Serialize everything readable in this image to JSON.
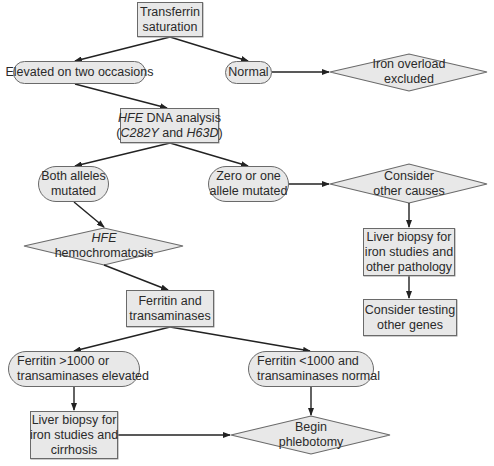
{
  "diagram": {
    "type": "flowchart",
    "colors": {
      "node_fill": "#e8e8e8",
      "node_stroke": "#6a6a6a",
      "edge": "#222222"
    },
    "nodes": {
      "transferrin": {
        "shape": "rectangle",
        "lines": [
          "Transferrin",
          "saturation"
        ]
      },
      "elevated": {
        "shape": "rounded",
        "lines": [
          "Elevated on two occasions"
        ]
      },
      "normal": {
        "shape": "rounded",
        "lines": [
          "Normal"
        ]
      },
      "iron_excluded": {
        "shape": "diamond",
        "lines": [
          "Iron overload",
          "excluded"
        ]
      },
      "hfe_dna": {
        "shape": "rectangle",
        "line1_italic": "HFE",
        "line1_rest": " DNA analysis",
        "line2_open": "(",
        "line2_it1": "C282Y",
        "line2_mid": " and ",
        "line2_it2": "H63D",
        "line2_close": ")"
      },
      "both_alleles": {
        "shape": "rounded",
        "lines": [
          "Both alleles",
          "mutated"
        ]
      },
      "zero_one": {
        "shape": "rounded",
        "lines": [
          "Zero or one",
          "allele mutated"
        ]
      },
      "consider_other": {
        "shape": "diamond",
        "lines": [
          "Consider",
          "other causes"
        ]
      },
      "hfe_hemo": {
        "shape": "diamond",
        "line1_italic": "HFE",
        "line2": "hemochromatosis"
      },
      "liver_biopsy_other": {
        "shape": "rectangle",
        "lines": [
          "Liver biopsy for",
          "iron studies and",
          "other pathology"
        ]
      },
      "consider_testing": {
        "shape": "rectangle",
        "lines": [
          "Consider testing",
          "other genes"
        ]
      },
      "ferritin_trans": {
        "shape": "rectangle",
        "lines": [
          "Ferritin and",
          "transaminases"
        ]
      },
      "ferritin_high": {
        "shape": "rounded",
        "lines": [
          "Ferritin >1000 or",
          "transaminases elevated"
        ]
      },
      "ferritin_low": {
        "shape": "rounded",
        "lines": [
          "Ferritin <1000 and",
          "transaminases normal"
        ]
      },
      "liver_biopsy_cirrhosis": {
        "shape": "rectangle",
        "lines": [
          "Liver biopsy for",
          "iron studies and",
          "cirrhosis"
        ]
      },
      "phlebotomy": {
        "shape": "diamond",
        "lines": [
          "Begin",
          "phlebotomy"
        ]
      }
    },
    "edges": [
      [
        "transferrin",
        "elevated"
      ],
      [
        "transferrin",
        "normal"
      ],
      [
        "normal",
        "iron_excluded"
      ],
      [
        "elevated",
        "hfe_dna"
      ],
      [
        "hfe_dna",
        "both_alleles"
      ],
      [
        "hfe_dna",
        "zero_one"
      ],
      [
        "zero_one",
        "consider_other"
      ],
      [
        "consider_other",
        "liver_biopsy_other"
      ],
      [
        "liver_biopsy_other",
        "consider_testing"
      ],
      [
        "both_alleles",
        "hfe_hemo"
      ],
      [
        "hfe_hemo",
        "ferritin_trans"
      ],
      [
        "ferritin_trans",
        "ferritin_high"
      ],
      [
        "ferritin_trans",
        "ferritin_low"
      ],
      [
        "ferritin_high",
        "liver_biopsy_cirrhosis"
      ],
      [
        "ferritin_low",
        "phlebotomy"
      ],
      [
        "liver_biopsy_cirrhosis",
        "phlebotomy"
      ]
    ]
  }
}
